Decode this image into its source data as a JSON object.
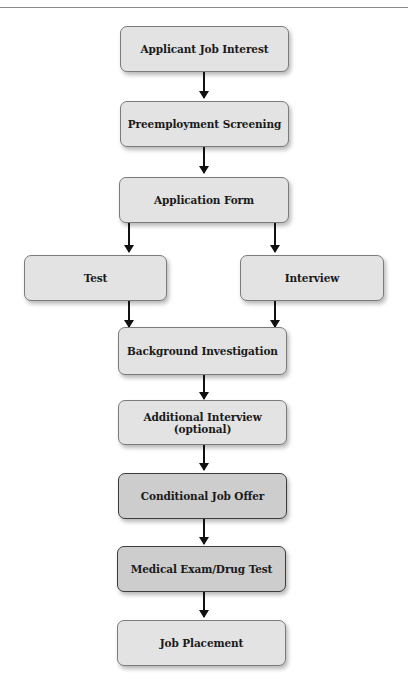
{
  "flowchart": {
    "title": "Hiring process flowchart",
    "colors": {
      "box_fill": "#e3e3e3",
      "box_fill_emphasis": "#cdcdcd",
      "border": "#7b7b7b",
      "border_emphasis": "#3c3c3c",
      "arrow": "#111111"
    },
    "nodes": [
      {
        "id": "applicant-job-interest",
        "label": "Applicant Job Interest"
      },
      {
        "id": "preemployment-screening",
        "label": "Preemployment Screening"
      },
      {
        "id": "application-form",
        "label": "Application Form"
      },
      {
        "id": "test",
        "label": "Test"
      },
      {
        "id": "interview",
        "label": "Interview"
      },
      {
        "id": "background-investigation",
        "label": "Background Investigation"
      },
      {
        "id": "additional-interview",
        "label": "Additional Interview (optional)"
      },
      {
        "id": "conditional-job-offer",
        "label": "Conditional Job Offer",
        "emphasis": true
      },
      {
        "id": "medical-exam",
        "label": "Medical Exam/Drug Test",
        "emphasis": true
      },
      {
        "id": "job-placement",
        "label": "Job Placement"
      }
    ],
    "edges": [
      [
        "applicant-job-interest",
        "preemployment-screening"
      ],
      [
        "preemployment-screening",
        "application-form"
      ],
      [
        "application-form",
        "test"
      ],
      [
        "application-form",
        "interview"
      ],
      [
        "test",
        "background-investigation"
      ],
      [
        "interview",
        "background-investigation"
      ],
      [
        "background-investigation",
        "additional-interview"
      ],
      [
        "additional-interview",
        "conditional-job-offer"
      ],
      [
        "conditional-job-offer",
        "medical-exam"
      ],
      [
        "medical-exam",
        "job-placement"
      ]
    ]
  }
}
